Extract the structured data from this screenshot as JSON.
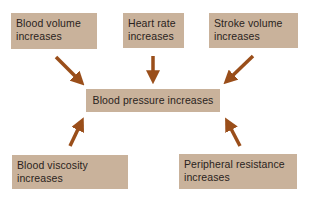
{
  "diagram": {
    "center": {
      "label": "Blood pressure increases"
    },
    "factors": [
      {
        "line1": "Blood volume",
        "line2": "increases",
        "position": "top-left"
      },
      {
        "line1": "Heart rate",
        "line2": "increases",
        "position": "top-center"
      },
      {
        "line1": "Stroke volume",
        "line2": "increases",
        "position": "top-right"
      },
      {
        "line1": "Blood viscosity",
        "line2": "increases",
        "position": "bottom-left"
      },
      {
        "line1": "Peripheral resistance",
        "line2": "increases",
        "position": "bottom-right"
      }
    ],
    "colors": {
      "box_fill": "#c9b29b",
      "arrow": "#9a4e1a",
      "text": "#2a2320",
      "background": "#ffffff"
    }
  }
}
